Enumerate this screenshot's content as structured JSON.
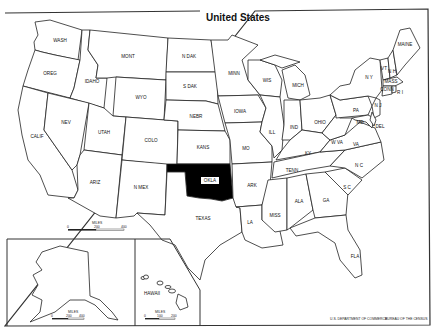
{
  "title": "United States",
  "highlight_color": "#000000",
  "highlighted_state": "OKLA",
  "states": [
    {
      "id": "wa",
      "label": "WASH"
    },
    {
      "id": "or",
      "label": "OREG"
    },
    {
      "id": "ca",
      "label": "CALIF"
    },
    {
      "id": "id",
      "label": "IDAHO"
    },
    {
      "id": "nv",
      "label": "NEV"
    },
    {
      "id": "mt",
      "label": "MONT"
    },
    {
      "id": "wy",
      "label": "WYO"
    },
    {
      "id": "ut",
      "label": "UTAH"
    },
    {
      "id": "az",
      "label": "ARIZ"
    },
    {
      "id": "co",
      "label": "COLO"
    },
    {
      "id": "nm",
      "label": "N MEX"
    },
    {
      "id": "nd",
      "label": "N DAK"
    },
    {
      "id": "sd",
      "label": "S DAK"
    },
    {
      "id": "ne",
      "label": "NEBR"
    },
    {
      "id": "ks",
      "label": "KANS"
    },
    {
      "id": "ok",
      "label": "OKLA"
    },
    {
      "id": "tx",
      "label": "TEXAS"
    },
    {
      "id": "mn",
      "label": "MINN"
    },
    {
      "id": "ia",
      "label": "IOWA"
    },
    {
      "id": "mo",
      "label": "MO"
    },
    {
      "id": "ar",
      "label": "ARK"
    },
    {
      "id": "la",
      "label": "LA"
    },
    {
      "id": "wi",
      "label": "WIS"
    },
    {
      "id": "il",
      "label": "ILL"
    },
    {
      "id": "mi",
      "label": "MICH"
    },
    {
      "id": "in",
      "label": "IND"
    },
    {
      "id": "oh",
      "label": "OHIO"
    },
    {
      "id": "ky",
      "label": "KY"
    },
    {
      "id": "tn",
      "label": "TENN"
    },
    {
      "id": "ms",
      "label": "MISS"
    },
    {
      "id": "al",
      "label": "ALA"
    },
    {
      "id": "ga",
      "label": "GA"
    },
    {
      "id": "fl",
      "label": "FLA"
    },
    {
      "id": "sc",
      "label": "S C"
    },
    {
      "id": "nc",
      "label": "N C"
    },
    {
      "id": "va",
      "label": "VA"
    },
    {
      "id": "wv",
      "label": "W VA"
    },
    {
      "id": "pa",
      "label": "PA"
    },
    {
      "id": "ny",
      "label": "N Y"
    },
    {
      "id": "vt",
      "label": "VT"
    },
    {
      "id": "nh",
      "label": "N H"
    },
    {
      "id": "me",
      "label": "MAINE"
    },
    {
      "id": "ma",
      "label": "MASS"
    },
    {
      "id": "ct",
      "label": "CONN"
    },
    {
      "id": "ri",
      "label": "R I"
    },
    {
      "id": "md",
      "label": "MD"
    },
    {
      "id": "de",
      "label": "DEL"
    },
    {
      "id": "nj",
      "label": "N J"
    },
    {
      "id": "ak",
      "label": "ALASKA"
    },
    {
      "id": "hi",
      "label": "HAWAII"
    }
  ],
  "scales": {
    "main": {
      "title": "MILES",
      "ticks": [
        "0",
        "200",
        "400"
      ]
    },
    "alaska": {
      "title": "MILES",
      "ticks": [
        "0",
        "200",
        "400"
      ]
    },
    "hawaii": {
      "title": "MILES",
      "ticks": [
        "0",
        "100",
        "200"
      ]
    }
  },
  "credit": {
    "left": "U.S. DEPARTMENT OF COMMERCE",
    "right": "BUREAU OF THE CENSUS"
  }
}
